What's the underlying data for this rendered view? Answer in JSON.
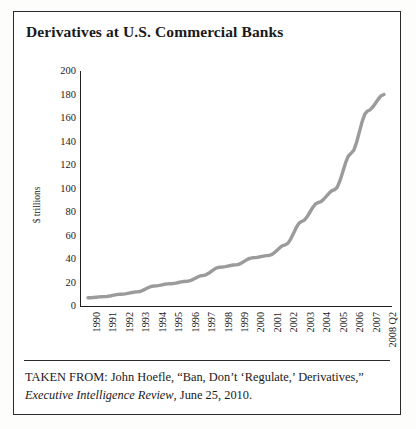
{
  "figure": {
    "title": "Derivatives at U.S. Commercial Banks",
    "caption_line1": "TAKEN FROM: John Hoefle, “Ban, Don’t ‘Regulate,’ Derivatives,”",
    "caption_source_italic": "Executive Intelligence Review",
    "caption_line2_rest": ", June 25, 2010."
  },
  "colors": {
    "series_line": "#9b9b9b",
    "axis": "#1f1f1f",
    "frame": "#2b2b2b",
    "background": "#ffffff",
    "text": "#1a1a1a"
  },
  "chart_data": {
    "type": "line",
    "title": "Derivatives at U.S. Commercial Banks",
    "xlabel": "",
    "ylabel": "$ trillions",
    "ylim": [
      0,
      200
    ],
    "ytick_step": 20,
    "grid": false,
    "legend": "none",
    "yticks": [
      200,
      180,
      160,
      140,
      120,
      100,
      80,
      60,
      40,
      20,
      0
    ],
    "categories": [
      "1990",
      "1991",
      "1992",
      "1993",
      "1994",
      "1995",
      "1996",
      "1997",
      "1998",
      "1999",
      "2000",
      "2001",
      "2002",
      "2003",
      "2004",
      "2005",
      "2006",
      "2007",
      "2008 Q2"
    ],
    "values": [
      7,
      8,
      10,
      12,
      17,
      19,
      21,
      26,
      33,
      35,
      41,
      43,
      52,
      72,
      88,
      99,
      130,
      166,
      180
    ],
    "series": [
      {
        "name": "Derivatives notional value",
        "units": "$ trillions",
        "values": [
          7,
          8,
          10,
          12,
          17,
          19,
          21,
          26,
          33,
          35,
          41,
          43,
          52,
          72,
          88,
          99,
          130,
          166,
          180
        ]
      }
    ]
  }
}
